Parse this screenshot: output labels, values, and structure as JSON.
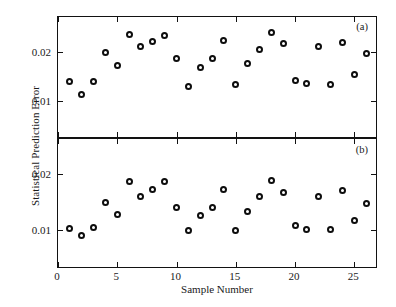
{
  "chart_data": {
    "type": "scatter",
    "title": "",
    "xlabel": "Sample Number",
    "ylabel": "Statistical Prediction Error",
    "xlim": [
      0,
      27
    ],
    "xticks": [
      0,
      5,
      10,
      15,
      20,
      25
    ],
    "xtick_labels": [
      "0",
      "5",
      "10",
      "15",
      "20",
      "25"
    ],
    "grid": false,
    "legend": "none",
    "marker": "open-circle",
    "marker_color": "#0d0d0d",
    "panels": [
      {
        "tag": "(a)",
        "ylim": [
          0.0027,
          0.0272
        ],
        "yticks": [
          0.01,
          0.02
        ],
        "ytick_labels": [
          "0.01",
          "0.02"
        ],
        "x": [
          1,
          2,
          3,
          4,
          5,
          6,
          7,
          8,
          9,
          10,
          11,
          12,
          13,
          14,
          15,
          16,
          17,
          18,
          19,
          20,
          21,
          22,
          23,
          24,
          25,
          26
        ],
        "values": [
          0.014,
          0.0113,
          0.014,
          0.02,
          0.0172,
          0.0237,
          0.0211,
          0.0222,
          0.0234,
          0.0187,
          0.0129,
          0.0169,
          0.0187,
          0.0223,
          0.0134,
          0.0177,
          0.0206,
          0.024,
          0.0217,
          0.0142,
          0.0135,
          0.0211,
          0.0134,
          0.022,
          0.0155,
          0.0197
        ]
      },
      {
        "tag": "(b)",
        "ylim": [
          0.0036,
          0.0262
        ],
        "yticks": [
          0.01,
          0.02
        ],
        "ytick_labels": [
          "0.01",
          "0.02"
        ],
        "x": [
          1,
          2,
          3,
          4,
          5,
          6,
          7,
          8,
          9,
          10,
          11,
          12,
          13,
          14,
          15,
          16,
          17,
          18,
          19,
          20,
          21,
          22,
          23,
          24,
          25,
          26
        ],
        "values": [
          0.0104,
          0.0091,
          0.0105,
          0.015,
          0.0128,
          0.0187,
          0.016,
          0.0172,
          0.0186,
          0.0141,
          0.0099,
          0.0126,
          0.0141,
          0.0173,
          0.01,
          0.0134,
          0.016,
          0.0188,
          0.0167,
          0.0108,
          0.0102,
          0.016,
          0.0102,
          0.017,
          0.0117,
          0.0148
        ]
      }
    ]
  }
}
